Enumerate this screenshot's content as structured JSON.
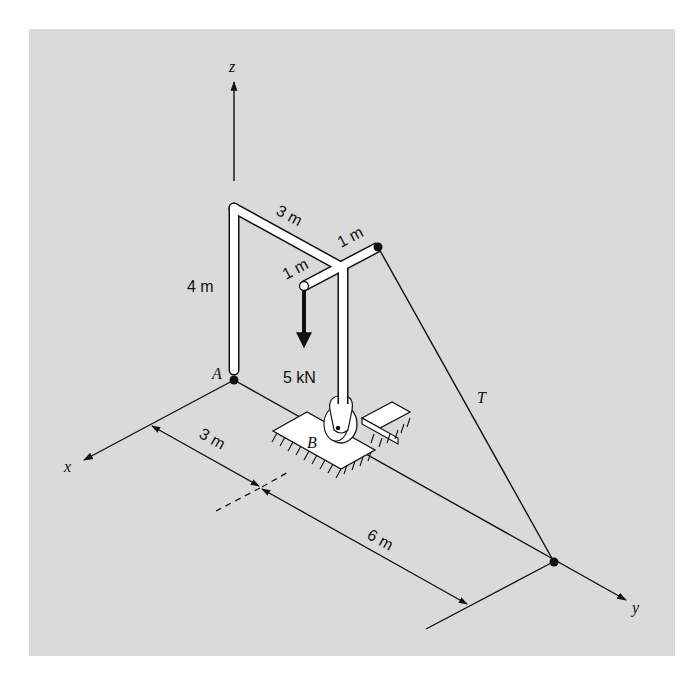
{
  "figure": {
    "background_color": "#dadada",
    "page_color": "#ffffff",
    "line_color": "#111111",
    "member_fill": "#ffffff"
  },
  "axes": {
    "x_label": "x",
    "y_label": "y",
    "z_label": "z"
  },
  "points": {
    "A": "A",
    "B": "B"
  },
  "dimensions": {
    "vertical_member": "4 m",
    "horizontal_member": "3 m",
    "arm_left": "1 m",
    "arm_right": "1 m",
    "base_x_offset": "3 m",
    "base_y_offset": "6 m"
  },
  "load": {
    "label": "5 kN"
  },
  "cable": {
    "label": "T"
  }
}
